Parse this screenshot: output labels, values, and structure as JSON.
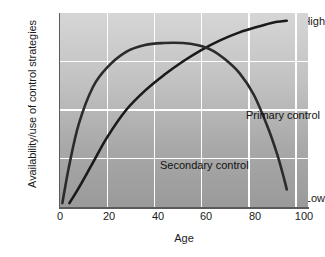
{
  "chart_data": {
    "type": "line",
    "title": "",
    "xlabel": "Age",
    "ylabel": "Availability/use of control strategies",
    "xlim": [
      0,
      105
    ],
    "ylim": [
      0,
      1
    ],
    "xticks": [
      "0",
      "20",
      "40",
      "60",
      "80",
      "100"
    ],
    "xtick_values": [
      0,
      20,
      40,
      60,
      80,
      100
    ],
    "yticks": [
      "Low",
      "High"
    ],
    "ytick_values": [
      0.06,
      1.0
    ],
    "grid": true,
    "grid_color": "#ffffff",
    "legend": "inline-labels",
    "background": "vertical gradient light-gray (top) to mid-gray (bottom)",
    "series": [
      {
        "name": "Primary control",
        "color": "#1a1a1a",
        "label_x": 64,
        "label_y": 0.44,
        "x": [
          4,
          8,
          14,
          20,
          28,
          36,
          44,
          52,
          60,
          68,
          76,
          84,
          90,
          96
        ],
        "y": [
          0.02,
          0.1,
          0.23,
          0.36,
          0.5,
          0.6,
          0.68,
          0.75,
          0.81,
          0.86,
          0.9,
          0.93,
          0.95,
          0.96
        ]
      },
      {
        "name": "Secondary control",
        "color": "#2b2b2b",
        "label_x": 17,
        "label_y": 0.21,
        "x": [
          1,
          4,
          8,
          14,
          20,
          28,
          36,
          44,
          52,
          58,
          64,
          70,
          76,
          82,
          88,
          92,
          95,
          96
        ],
        "y": [
          0.02,
          0.22,
          0.43,
          0.62,
          0.72,
          0.8,
          0.835,
          0.845,
          0.845,
          0.835,
          0.81,
          0.76,
          0.69,
          0.58,
          0.41,
          0.27,
          0.14,
          0.09
        ]
      }
    ],
    "annotations": [
      {
        "text": "Primary control",
        "x": 186,
        "y": 96
      },
      {
        "text": "Secondary control",
        "x": 100,
        "y": 146
      }
    ]
  },
  "axes": {
    "x_label": "Age",
    "y_label": "Availability/use of control strategies",
    "y_tick_high": "High",
    "y_tick_low": "Low",
    "x_tick_0": "0",
    "x_tick_20": "20",
    "x_tick_40": "40",
    "x_tick_60": "60",
    "x_tick_80": "80",
    "x_tick_100": "100"
  },
  "labels": {
    "primary": "Primary control",
    "secondary": "Secondary control"
  },
  "colors": {
    "curve_primary": "#1a1a1a",
    "curve_secondary": "#2b2b2b",
    "grid": "#ffffff",
    "axis": "#5a5a5a",
    "text": "#1a1a1a",
    "plot_bg_top": "#d2d2d2",
    "plot_bg_bottom": "#9a9a9a"
  }
}
